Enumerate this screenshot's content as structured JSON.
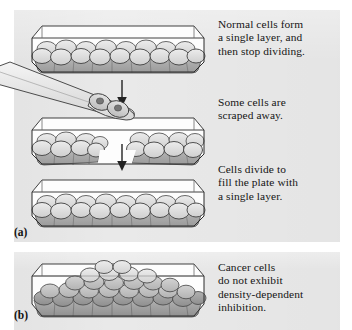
{
  "figure": {
    "background_color": "#e9e9e9",
    "page_color": "#ffffff",
    "ink_color": "#151515"
  },
  "panels": [
    {
      "id": "a",
      "letter": "(a)",
      "subject": "normal-cells",
      "steps": [
        {
          "order": 1,
          "dish_name": "culture-dish-normal-monolayer",
          "caption": "Normal cells form\na single layer, and\nthen stop dividing.",
          "state": "confluent-monolayer"
        },
        {
          "order": 2,
          "dish_name": "culture-dish-scraped",
          "caption": "Some cells are\nscraped away.",
          "state": "monolayer-with-gap"
        },
        {
          "order": 3,
          "dish_name": "culture-dish-refilled",
          "caption": "Cells divide to\nfill the plate with\na single layer.",
          "state": "confluent-monolayer"
        }
      ]
    },
    {
      "id": "b",
      "letter": "(b)",
      "subject": "cancer-cells",
      "steps": [
        {
          "order": 1,
          "dish_name": "culture-dish-cancer-mound",
          "caption": "Cancer cells\ndo not exhibit\ndensity-dependent\ninhibition.",
          "state": "multilayered-mound"
        }
      ]
    }
  ],
  "scraper": {
    "name": "cell-scraper-tool",
    "cells_removed": 2,
    "nuclei_per_cell": 1
  },
  "arrows": [
    {
      "name": "flow-arrow-step1-to-step2",
      "direction": "down"
    },
    {
      "name": "flow-arrow-step2-to-step3",
      "direction": "down"
    }
  ],
  "colors": {
    "cell_light": "#dedede",
    "cell_mid": "#c9c9c9",
    "cell_dark": "#a8a8a8",
    "cell_darker": "#8f8f8f",
    "dish_outline": "#2b2b2b",
    "dish_glass": "#fdfdfd",
    "nucleus": "#6f6f6f"
  }
}
